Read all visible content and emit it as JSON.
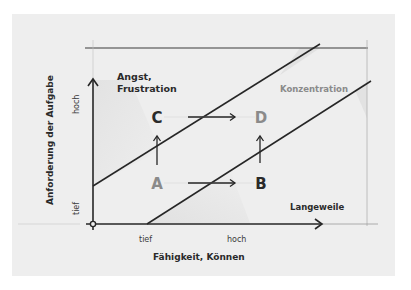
{
  "diagram": {
    "type": "flow-channel",
    "y_axis": {
      "title": "Anforderung der Aufgabe",
      "tick_high": "hoch",
      "tick_low": "tief"
    },
    "x_axis": {
      "title": "Fähigkeit, Können",
      "tick_low": "tief",
      "tick_high": "hoch"
    },
    "regions": {
      "upper": [
        "Angst,",
        "Frustration"
      ],
      "middle": "Konzentration",
      "lower": "Langeweile"
    },
    "points": {
      "a": "A",
      "b": "B",
      "c": "C",
      "d": "D"
    },
    "colors": {
      "paper": "#eeeeee",
      "ink": "#262626",
      "faint": "#8c8c8c"
    }
  }
}
